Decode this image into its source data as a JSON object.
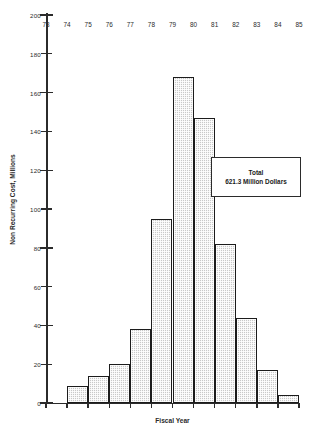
{
  "chart_data": {
    "type": "bar",
    "title": "",
    "xlabel": "Fiscal Year",
    "ylabel": "Non Recurring Cost, Millions",
    "categories": [
      "73",
      "74",
      "75",
      "76",
      "77",
      "78",
      "79",
      "80",
      "81",
      "82",
      "83",
      "84",
      "85"
    ],
    "values": [
      0,
      9,
      14,
      20,
      38,
      95,
      168,
      147,
      82,
      44,
      17,
      4,
      0
    ],
    "ylim": [
      0,
      200
    ],
    "ytick_labels": [
      "0",
      "20",
      "40",
      "60",
      "80",
      "100",
      "120",
      "140",
      "160",
      "180",
      "200"
    ],
    "ytick_values": [
      0,
      20,
      40,
      60,
      80,
      100,
      120,
      140,
      160,
      180,
      200
    ],
    "grid": false,
    "legend": "none",
    "bar_style": "cross-hatched gray with black outline",
    "annotations": [
      {
        "line1": "Total",
        "line2": "621.3 Million Dollars"
      }
    ]
  },
  "annotation": {
    "label": "Total",
    "value": "621.3 Million Dollars"
  },
  "axes": {
    "x_title": "Fiscal Year",
    "y_title": "Non Recurring Cost, Millions"
  },
  "colors": {
    "bar_fill": "#c9c9c9",
    "bar_outline": "#1c1c1c",
    "axis": "#2b2b2b",
    "background": "#ffffff"
  }
}
